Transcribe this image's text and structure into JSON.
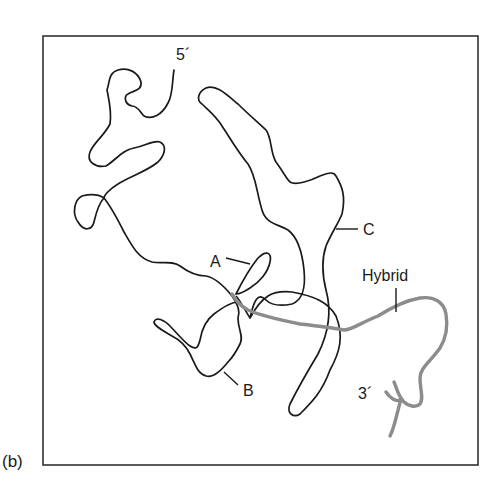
{
  "figure": {
    "panel_label": "(b)",
    "labels": {
      "five_prime": "5´",
      "three_prime": "3´",
      "a": "A",
      "b": "B",
      "c": "C",
      "hybrid": "Hybrid"
    },
    "colors": {
      "single_strand": "#1a1a1a",
      "hybrid_strand": "#8c8c8c",
      "frame": "#333333",
      "background": "#ffffff"
    },
    "frame": {
      "left": 43,
      "top": 36,
      "right": 478,
      "bottom": 465
    }
  }
}
